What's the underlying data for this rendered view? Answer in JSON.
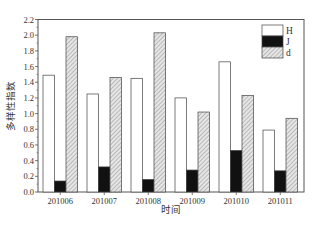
{
  "chart_data": {
    "type": "bar",
    "title": "",
    "xlabel": "时间",
    "ylabel": "多样性指数",
    "ylim": [
      0,
      2.2
    ],
    "yticks": [
      0.0,
      0.2,
      0.4,
      0.6,
      0.8,
      1.0,
      1.2,
      1.4,
      1.6,
      1.8,
      2.0,
      2.2
    ],
    "categories": [
      "201006",
      "201007",
      "201008",
      "201009",
      "201010",
      "201011"
    ],
    "series": [
      {
        "name": "H",
        "fill": "#ffffff",
        "values": [
          1.49,
          1.25,
          1.45,
          1.2,
          1.66,
          0.79
        ]
      },
      {
        "name": "J",
        "fill": "#111111",
        "values": [
          0.14,
          0.32,
          0.16,
          0.28,
          0.53,
          0.27
        ]
      },
      {
        "name": "d",
        "fill": "hatch",
        "values": [
          1.98,
          1.46,
          2.03,
          1.02,
          1.23,
          0.94
        ]
      }
    ],
    "legend": {
      "position": "upper-right",
      "entries": [
        "H",
        "J",
        "d"
      ]
    },
    "grid": false
  }
}
